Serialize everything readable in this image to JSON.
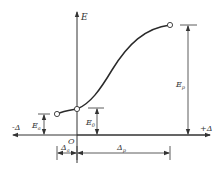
{
  "diagram": {
    "type": "load-displacement curve",
    "axes": {
      "vertical_label": "E",
      "origin_label": "O",
      "negative_horizontal_label": "-Δ",
      "positive_horizontal_label": "+Δ"
    },
    "dimensions": {
      "Ea": {
        "main": "E",
        "sub": "a"
      },
      "E0": {
        "main": "E",
        "sub": "0"
      },
      "Ep": {
        "main": "E",
        "sub": "p"
      },
      "delta_a": {
        "main": "Δ",
        "sub": "a"
      },
      "delta_p": {
        "main": "Δ",
        "sub": "p"
      }
    },
    "points": [
      {
        "name": "active-limit-point",
        "x": -1,
        "y": "Ea"
      },
      {
        "name": "at-rest-point",
        "x": 0,
        "y": "E0"
      },
      {
        "name": "passive-limit-point",
        "x": "Δp",
        "y": "Ep"
      }
    ],
    "colors": {
      "line": "#333333",
      "background": "#ffffff"
    }
  }
}
